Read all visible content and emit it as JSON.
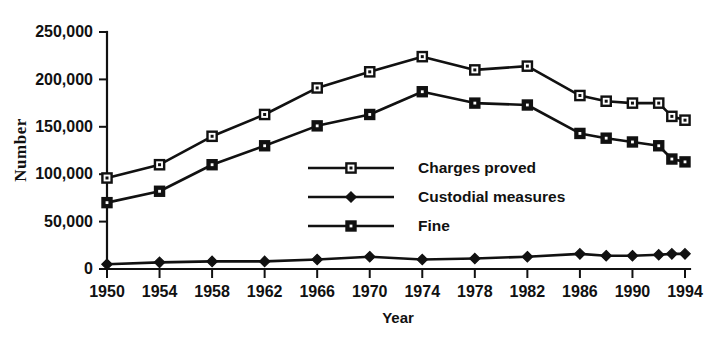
{
  "chart_data": {
    "type": "line",
    "title": "",
    "xlabel": "Year",
    "ylabel": "Number",
    "xlim": [
      1950,
      1994
    ],
    "ylim": [
      0,
      250000
    ],
    "grid": false,
    "legend_position": "center",
    "x_tick_labels": [
      "1950",
      "1954",
      "1958",
      "1962",
      "1966",
      "1970",
      "1974",
      "1978",
      "1982",
      "1986",
      "1990",
      "1994"
    ],
    "x_ticks": [
      1950,
      1954,
      1958,
      1962,
      1966,
      1970,
      1974,
      1978,
      1982,
      1986,
      1990,
      1994
    ],
    "y_tick_labels": [
      "0",
      "50,000",
      "100,000",
      "150,000",
      "200,000",
      "250,000"
    ],
    "y_ticks": [
      0,
      50000,
      100000,
      150000,
      200000,
      250000
    ],
    "x": [
      1950,
      1954,
      1958,
      1962,
      1966,
      1970,
      1974,
      1978,
      1982,
      1986,
      1988,
      1990,
      1992,
      1993,
      1994
    ],
    "series": [
      {
        "name": "Charges proved",
        "marker": "open-square",
        "values": [
          96000,
          110000,
          140000,
          163000,
          191000,
          208000,
          224000,
          210000,
          214000,
          183000,
          177000,
          175000,
          175000,
          161000,
          157000
        ]
      },
      {
        "name": "Custodial measures",
        "marker": "filled-diamond",
        "values": [
          5000,
          7000,
          8000,
          8000,
          10000,
          13000,
          10000,
          11000,
          13000,
          16000,
          14000,
          14000,
          15000,
          16000,
          16000
        ]
      },
      {
        "name": "Fine",
        "marker": "filled-square",
        "values": [
          70000,
          82000,
          110000,
          130000,
          151000,
          163000,
          187000,
          175000,
          173000,
          143000,
          138000,
          134000,
          130000,
          116000,
          113000
        ]
      }
    ]
  },
  "legend": {
    "items": [
      {
        "label": "Charges proved",
        "marker": "open-square"
      },
      {
        "label": "Custodial measures",
        "marker": "filled-diamond"
      },
      {
        "label": "Fine",
        "marker": "filled-square"
      }
    ]
  },
  "colors": {
    "ink": "#111111",
    "background": "#ffffff"
  }
}
